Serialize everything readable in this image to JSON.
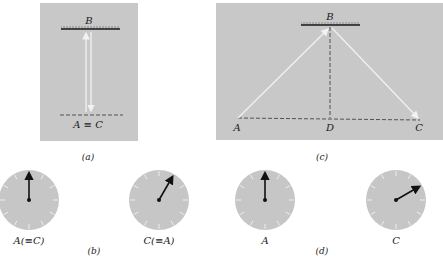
{
  "colors": {
    "panel_bg": "#c8c8c8",
    "light_path": "#f2f2f2",
    "ink": "#1a1a1a",
    "clock_face": "#c6c6c6",
    "clock_ticks": "#eeeeee"
  },
  "panel_a": {
    "caption": "(a)",
    "mirror_label": "B",
    "bottom_label": "A ≡ C"
  },
  "panel_c": {
    "caption": "(c)",
    "mirror_label": "B",
    "left_label": "A",
    "mid_label": "D",
    "right_label": "C"
  },
  "panel_b": {
    "caption": "(b)",
    "clocks": [
      {
        "label": "A(≡C)",
        "hand_angle_deg": 0
      },
      {
        "label": "C(≡A)",
        "hand_angle_deg": 30
      }
    ]
  },
  "panel_d": {
    "caption": "(d)",
    "clocks": [
      {
        "label": "A",
        "hand_angle_deg": 0
      },
      {
        "label": "C",
        "hand_angle_deg": 60
      }
    ]
  }
}
